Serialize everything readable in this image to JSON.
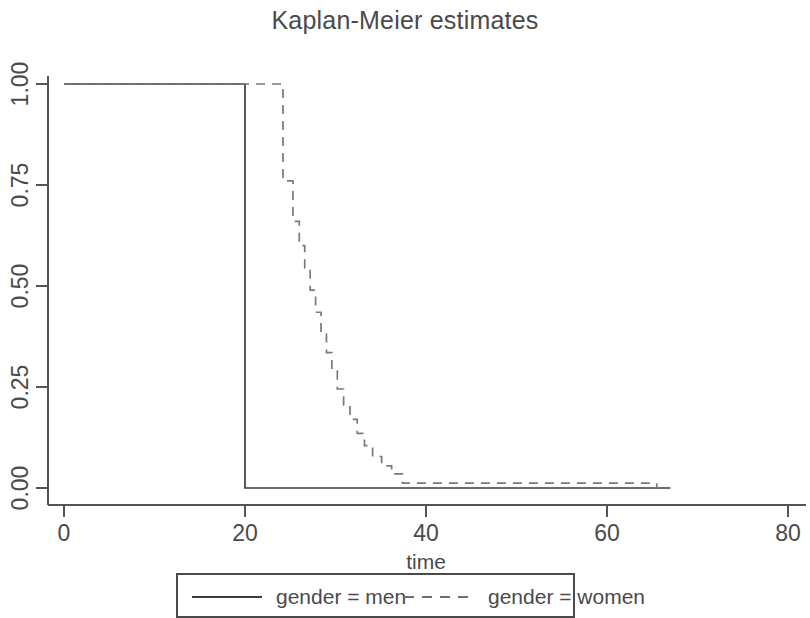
{
  "chart_data": {
    "type": "line",
    "title": "Kaplan-Meier estimates",
    "xlabel": "time",
    "ylabel": "",
    "xlim": [
      0,
      80
    ],
    "ylim": [
      0,
      1
    ],
    "grid": false,
    "legend_position": "bottom",
    "xticks": [
      0,
      20,
      40,
      60,
      80
    ],
    "xtick_labels": [
      "0",
      "20",
      "40",
      "60",
      "80"
    ],
    "yticks": [
      0,
      0.25,
      0.5,
      0.75,
      1
    ],
    "ytick_labels": [
      "0.00",
      "0.25",
      "0.50",
      "0.75",
      "1.00"
    ],
    "series": [
      {
        "name": "gender = men",
        "style": "solid",
        "color": "#3c3c3c",
        "step": "post",
        "x": [
          0,
          20,
          20,
          67
        ],
        "y": [
          1.0,
          1.0,
          0.0,
          0.0
        ],
        "points": [
          {
            "time": 0,
            "survival": 1.0
          },
          {
            "time": 20,
            "survival": 1.0
          },
          {
            "time": 20,
            "survival": 0.0
          },
          {
            "time": 67,
            "survival": 0.0
          }
        ]
      },
      {
        "name": "gender = women",
        "style": "dashed",
        "color": "#7a7a7a",
        "step": "post",
        "x": [
          0,
          23.0,
          24.2,
          25.3,
          26.0,
          26.6,
          27.2,
          27.8,
          28.4,
          29.0,
          29.6,
          30.2,
          30.9,
          31.6,
          32.4,
          33.2,
          34.1,
          35.1,
          36.2,
          37.4,
          65.5
        ],
        "y": [
          1.0,
          1.0,
          0.76,
          0.66,
          0.6,
          0.545,
          0.49,
          0.435,
          0.385,
          0.335,
          0.29,
          0.245,
          0.205,
          0.17,
          0.135,
          0.105,
          0.078,
          0.055,
          0.035,
          0.012,
          0.0
        ],
        "points": [
          {
            "time": 0,
            "survival": 1.0
          },
          {
            "time": 23.0,
            "survival": 1.0
          },
          {
            "time": 24.2,
            "survival": 0.76
          },
          {
            "time": 25.3,
            "survival": 0.66
          },
          {
            "time": 26.0,
            "survival": 0.6
          },
          {
            "time": 26.6,
            "survival": 0.545
          },
          {
            "time": 27.2,
            "survival": 0.49
          },
          {
            "time": 27.8,
            "survival": 0.435
          },
          {
            "time": 28.4,
            "survival": 0.385
          },
          {
            "time": 29.0,
            "survival": 0.335
          },
          {
            "time": 29.6,
            "survival": 0.29
          },
          {
            "time": 30.2,
            "survival": 0.245
          },
          {
            "time": 30.9,
            "survival": 0.205
          },
          {
            "time": 31.6,
            "survival": 0.17
          },
          {
            "time": 32.4,
            "survival": 0.135
          },
          {
            "time": 33.2,
            "survival": 0.105
          },
          {
            "time": 34.1,
            "survival": 0.078
          },
          {
            "time": 35.1,
            "survival": 0.055
          },
          {
            "time": 36.2,
            "survival": 0.035
          },
          {
            "time": 37.4,
            "survival": 0.012
          },
          {
            "time": 65.5,
            "survival": 0.0
          }
        ]
      }
    ]
  },
  "legend": {
    "entries": [
      {
        "label": "gender = men",
        "style": "solid"
      },
      {
        "label": "gender = women",
        "style": "dashed"
      }
    ]
  },
  "colors": {
    "men": "#3c3c3c",
    "women": "#7a7a7a",
    "axis": "#555555",
    "text": "#4a4a4a",
    "background": "#ffffff"
  }
}
